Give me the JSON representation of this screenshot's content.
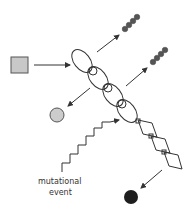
{
  "diagram": {
    "label_line1": "mutational",
    "label_line2": "event",
    "colors": {
      "stroke": "#333333",
      "square_fill": "#c8c8c8",
      "gray_circle_fill": "#cccccc",
      "black_circle_fill": "#1e1e1e",
      "dot_fill": "#555555"
    },
    "elements": [
      "input-square",
      "ellipse-chain",
      "diamond-chain",
      "bead-chain-top",
      "bead-chain-right",
      "gray-circle",
      "black-circle",
      "zigzag-arrow"
    ]
  }
}
